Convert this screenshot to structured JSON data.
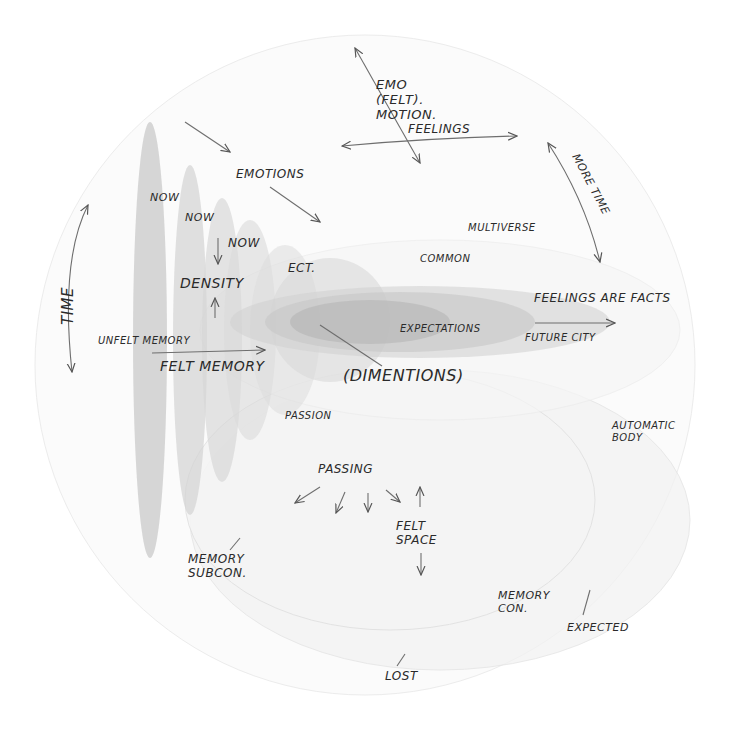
{
  "diagram": {
    "type": "hand-drawn conceptual diagram",
    "colors": {
      "ink": "#2a2a2a",
      "arrow": "#6e6e6e",
      "shape_fill": "#9a9a9a",
      "circle_stroke": "#e6e6e6"
    },
    "labels": {
      "emo_felt": "EMO\n(FELT).\nMOTION.",
      "feelings": "FEELINGS",
      "more_time": "MORE TIME",
      "emotions": "EMOTIONS",
      "now_1": "NOW",
      "now_2": "NOW",
      "now_3": "NOW",
      "density": "DENSITY",
      "ect": "ECT.",
      "multiverse": "MULTIVERSE",
      "common": "COMMON",
      "time": "TIME",
      "feelings_are_facts": "FEELINGS ARE FACTS",
      "future_city": "FUTURE CITY",
      "unfelt_memory": "UNFELT MEMORY",
      "felt_memory": "FELT MEMORY",
      "expectations": "EXPECTATIONS",
      "dimentions": "(DIMENTIONS)",
      "passion": "PASSION",
      "automatic_body": "AUTOMATIC\nBODY",
      "passing": "PASSING",
      "felt_space": "FELT\nSPACE",
      "memory_subcon": "MEMORY\nSUBCON.",
      "memory_con": "MEMORY\nCON.",
      "expected": "EXPECTED",
      "lost": "LOST"
    }
  }
}
